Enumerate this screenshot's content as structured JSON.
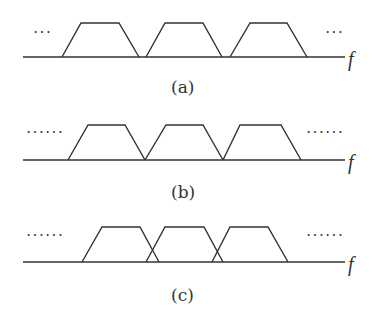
{
  "panels": [
    {
      "id": "a",
      "caption": "(a)",
      "axis_label": "f",
      "left_dots": "···",
      "right_dots": "···",
      "description": "spectra separated with guard gaps",
      "baseline_y": 57,
      "top_y": 23,
      "axis": [
        23,
        345
      ],
      "trapezoids": [
        [
          62,
          81,
          119,
          139
        ],
        [
          146,
          165,
          203,
          222
        ],
        [
          230,
          250,
          287,
          307
        ]
      ],
      "dots_left_x": 33,
      "dots_right_x": 325,
      "dots_y": 24,
      "f_x": 348,
      "f_y": 48,
      "caption_x": 171,
      "caption_y": 77
    },
    {
      "id": "b",
      "caption": "(b)",
      "axis_label": "f",
      "left_dots": "······",
      "right_dots": "······",
      "description": "spectra just touching",
      "baseline_y": 160,
      "top_y": 125,
      "axis": [
        23,
        345
      ],
      "trapezoids": [
        [
          68,
          88,
          125,
          145
        ],
        [
          145,
          166,
          203,
          223
        ],
        [
          223,
          240,
          281,
          301
        ]
      ],
      "dots_left_x": 26,
      "dots_right_x": 306,
      "dots_y": 124,
      "f_x": 348,
      "f_y": 151,
      "caption_x": 171,
      "caption_y": 182
    },
    {
      "id": "c",
      "caption": "(c)",
      "axis_label": "f",
      "left_dots": "······",
      "right_dots": "······",
      "description": "spectra overlapping",
      "baseline_y": 262,
      "top_y": 227,
      "axis": [
        23,
        345
      ],
      "trapezoids": [
        [
          82,
          102,
          140,
          159
        ],
        [
          146,
          165,
          204,
          223
        ],
        [
          212,
          230,
          268,
          288
        ]
      ],
      "dots_left_x": 26,
      "dots_right_x": 306,
      "dots_y": 227,
      "f_x": 348,
      "f_y": 253,
      "caption_x": 171,
      "caption_y": 285
    }
  ],
  "colors": {
    "line": "#333333",
    "background": "#ffffff"
  }
}
